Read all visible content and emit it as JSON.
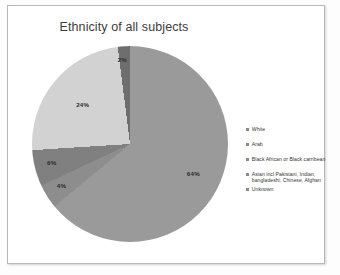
{
  "chart": {
    "title": "Ethnicity of all subjects"
  },
  "legend": {
    "items": [
      {
        "label": "White",
        "marker": "legend-swatch-white"
      },
      {
        "label": "Arab",
        "marker": "legend-swatch-arab"
      },
      {
        "label": "Black African or Black carribean",
        "marker": "legend-swatch-black-african"
      },
      {
        "label": "Asian incl Pakistani, Indian, bangladeshi, Chinese, Afghan",
        "marker": "legend-swatch-asian"
      },
      {
        "label": "Unknown",
        "marker": "legend-swatch-unknown"
      }
    ]
  },
  "labels": {
    "white": "64%",
    "arab": "4%",
    "black_african": "6%",
    "asian": "24%",
    "unknown": "2%"
  },
  "chart_data": {
    "type": "pie",
    "title": "Ethnicity of all subjects",
    "categories": [
      "White",
      "Arab",
      "Black African or Black carribean",
      "Asian incl Pakistani, Indian, bangladeshi, Chinese, Afghan",
      "Unknown"
    ],
    "values": [
      64,
      4,
      6,
      24,
      2
    ],
    "value_labels": [
      "64%",
      "4%",
      "6%",
      "24%",
      "2%"
    ],
    "units": "percent",
    "start_angle_deg": 0,
    "direction": "clockwise",
    "colors": [
      "#9a9a9a",
      "#8d8d8d",
      "#808080",
      "#d2d2d2",
      "#6e6e6e"
    ],
    "legend_position": "right",
    "grid": false,
    "xlabel": "",
    "ylabel": ""
  },
  "colors": {
    "slice_white": "#9a9a9a",
    "slice_arab": "#8d8d8d",
    "slice_black_african": "#808080",
    "slice_asian": "#d2d2d2",
    "slice_unknown": "#6e6e6e",
    "title_text": "#3c3c3c",
    "frame_border": "#b9b9b9",
    "page_background": "#ffffff"
  }
}
